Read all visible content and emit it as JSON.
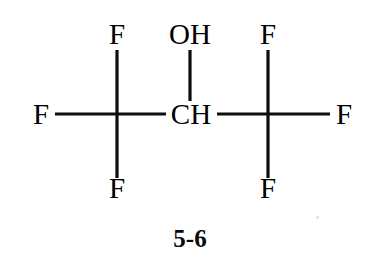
{
  "figure": {
    "kind": "chemical-structure-diagram",
    "caption": "5-6",
    "background_color": "#ffffff",
    "ink_color": "#000000"
  },
  "labels": {
    "top_left_fluorine": "F",
    "hydroxyl": "OH",
    "top_right_fluorine": "F",
    "left_fluorine": "F",
    "central_carbon": "CH",
    "right_fluorine": "F",
    "bottom_left_fluorine": "F",
    "bottom_right_fluorine": "F"
  },
  "atoms": [
    {
      "id": "f-top-left",
      "label": "F",
      "x": 117,
      "y": 44,
      "kind": "fluorine"
    },
    {
      "id": "oh",
      "label": "OH",
      "x": 190,
      "y": 44,
      "kind": "hydroxyl"
    },
    {
      "id": "f-top-right",
      "label": "F",
      "x": 268,
      "y": 44,
      "kind": "fluorine"
    },
    {
      "id": "f-left",
      "label": "F",
      "x": 43,
      "y": 123,
      "kind": "fluorine"
    },
    {
      "id": "c-left",
      "label": "",
      "x": 117,
      "y": 114,
      "kind": "carbon-implicit"
    },
    {
      "id": "c-center",
      "label": "CH",
      "x": 190,
      "y": 123,
      "kind": "carbon"
    },
    {
      "id": "c-right",
      "label": "",
      "x": 268,
      "y": 114,
      "kind": "carbon-implicit"
    },
    {
      "id": "f-right",
      "label": "F",
      "x": 342,
      "y": 123,
      "kind": "fluorine"
    },
    {
      "id": "f-bottom-left",
      "label": "F",
      "x": 117,
      "y": 196,
      "kind": "fluorine"
    },
    {
      "id": "f-bottom-right",
      "label": "F",
      "x": 268,
      "y": 196,
      "kind": "fluorine"
    }
  ],
  "bonds": [
    {
      "id": "bond-ctl-ftl",
      "from": "c-left",
      "to": "f-top-left",
      "x1": 117,
      "y1": 114,
      "x2": 117,
      "y2": 50,
      "order": 1
    },
    {
      "id": "bond-ctl-fbl",
      "from": "c-left",
      "to": "f-bottom-left",
      "x1": 117,
      "y1": 114,
      "x2": 117,
      "y2": 178,
      "order": 1
    },
    {
      "id": "bond-ctl-fl",
      "from": "c-left",
      "to": "f-left",
      "x1": 117,
      "y1": 114,
      "x2": 55,
      "y2": 114,
      "order": 1
    },
    {
      "id": "bond-ctl-cc",
      "from": "c-left",
      "to": "c-center",
      "x1": 117,
      "y1": 114,
      "x2": 165,
      "y2": 114,
      "order": 1
    },
    {
      "id": "bond-cc-oh",
      "from": "c-center",
      "to": "oh",
      "x1": 190,
      "y1": 100,
      "x2": 190,
      "y2": 50,
      "order": 1
    },
    {
      "id": "bond-cc-ctr",
      "from": "c-center",
      "to": "c-right",
      "x1": 216,
      "y1": 114,
      "x2": 268,
      "y2": 114,
      "order": 1
    },
    {
      "id": "bond-ctr-ftr",
      "from": "c-right",
      "to": "f-top-right",
      "x1": 268,
      "y1": 114,
      "x2": 268,
      "y2": 50,
      "order": 1
    },
    {
      "id": "bond-ctr-fbr",
      "from": "c-right",
      "to": "f-bottom-right",
      "x1": 268,
      "y1": 114,
      "x2": 268,
      "y2": 178,
      "order": 1
    },
    {
      "id": "bond-ctr-fr",
      "from": "c-right",
      "to": "f-right",
      "x1": 268,
      "y1": 114,
      "x2": 330,
      "y2": 114,
      "order": 1
    }
  ],
  "caption_block": {
    "text": "5-6",
    "x": 190,
    "y": 247
  }
}
